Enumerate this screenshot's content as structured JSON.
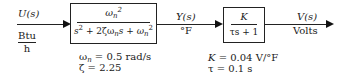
{
  "input": {
    "signal": "U(s)",
    "unit_numerator": "Btu",
    "unit_denominator": "h"
  },
  "block1": {
    "numerator": "ωn²",
    "denominator": "s² + 2ζωn s + ωn²",
    "params": [
      "ωn = 0.5 rad/s",
      "ζ = 2.25"
    ],
    "omega_symbol": "ω",
    "subscript_n": "n",
    "eq_value_wn": " = 0.5 rad/s",
    "zeta_line": "ζ = 2.25",
    "den_s": "s",
    "den_mid": " + 2ζω",
    "den_s2": "s + ω"
  },
  "middle": {
    "signal": "Y(s)",
    "unit": "°F"
  },
  "block2": {
    "numerator": "K",
    "denominator": "τs + 1",
    "params": [
      "K = 0.04 V/°F",
      "τ = 0.1 s"
    ],
    "k_symbol": "K",
    "k_value": " = 0.04 V/°F",
    "tau_line": "τ = 0.1 s"
  },
  "output": {
    "signal": "V(s)",
    "unit": "Volts"
  }
}
